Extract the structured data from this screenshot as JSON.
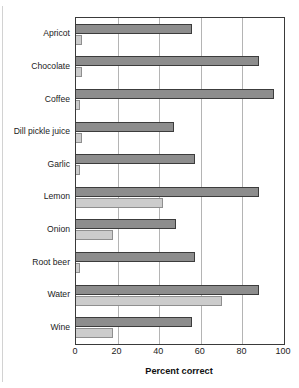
{
  "chart_data": {
    "type": "bar",
    "orientation": "horizontal",
    "title": "",
    "xlabel": "Percent correct",
    "ylabel": "",
    "xlim": [
      0,
      100
    ],
    "xticks": [
      0,
      20,
      40,
      60,
      80,
      100
    ],
    "grid": true,
    "grid_axis": "x",
    "legend": null,
    "categories": [
      "Apricot",
      "Chocolate",
      "Coffee",
      "Dill pickle juice",
      "Garlic",
      "Lemon",
      "Onion",
      "Root beer",
      "Water",
      "Wine"
    ],
    "series": [
      {
        "name": "dark",
        "color": "#8d8d8d",
        "values": [
          56,
          88,
          95,
          47,
          57,
          88,
          48,
          57,
          88,
          56
        ]
      },
      {
        "name": "light",
        "color": "#cccccc",
        "values": [
          3,
          3,
          2,
          3,
          2,
          42,
          18,
          2,
          70,
          18
        ]
      }
    ]
  },
  "axis": {
    "tick_labels": [
      "0",
      "20",
      "40",
      "60",
      "80",
      "100"
    ],
    "title": "Percent correct"
  },
  "colors": {
    "bar_dark": "#8d8d8d",
    "bar_light": "#cccccc",
    "bar_dark_edge": "#3c3c3c",
    "bar_light_edge": "#8f8f8f",
    "plot_border": "#3a3a3a",
    "gridline": "#b4b4b4",
    "text": "#1b1b1b",
    "background": "#ffffff"
  }
}
